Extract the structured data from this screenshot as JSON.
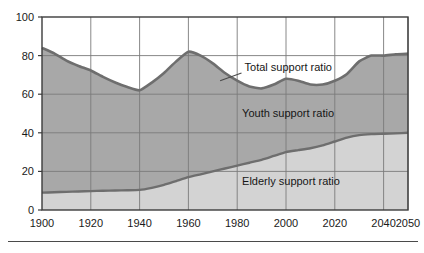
{
  "chart_data": {
    "type": "area",
    "title": "",
    "subtitle": "",
    "xlabel": "",
    "ylabel": "",
    "xlim": [
      1900,
      2050
    ],
    "ylim": [
      0,
      100
    ],
    "grid": true,
    "stacked": true,
    "legend_position": "inline-annotations",
    "xticks": [
      1900,
      1920,
      1940,
      1960,
      1980,
      2000,
      2020,
      2040,
      2050
    ],
    "xtick_labels": [
      "1900",
      "1920",
      "1940",
      "1960",
      "1980",
      "2000",
      "2020",
      "2040",
      "2050"
    ],
    "yticks": [
      0,
      20,
      40,
      60,
      80,
      100
    ],
    "ytick_labels": [
      "0",
      "20",
      "40",
      "60",
      "80",
      "100"
    ],
    "x": [
      1900,
      1905,
      1910,
      1915,
      1920,
      1925,
      1930,
      1935,
      1940,
      1945,
      1950,
      1955,
      1960,
      1965,
      1970,
      1975,
      1980,
      1985,
      1990,
      1995,
      2000,
      2005,
      2010,
      2015,
      2020,
      2025,
      2030,
      2035,
      2040,
      2045,
      2050
    ],
    "series": [
      {
        "name": "Elderly support ratio",
        "color": "#d3d3d3",
        "values": [
          9.0,
          9.2,
          9.4,
          9.6,
          9.8,
          10.0,
          10.1,
          10.2,
          10.4,
          11.5,
          13.0,
          15.0,
          17.0,
          18.5,
          20.0,
          21.5,
          23.0,
          24.5,
          26.0,
          28.0,
          30.0,
          31.0,
          32.0,
          33.5,
          35.5,
          37.5,
          38.8,
          39.3,
          39.5,
          39.7,
          40.0
        ]
      },
      {
        "name": "Youth support ratio",
        "color": "#a8a8a8",
        "values": [
          75.0,
          72.0,
          68.0,
          65.0,
          62.5,
          59.0,
          56.0,
          53.5,
          51.6,
          54.5,
          58.0,
          62.0,
          65.0,
          61.5,
          56.0,
          49.5,
          44.0,
          39.5,
          37.0,
          37.0,
          38.0,
          36.0,
          33.0,
          31.5,
          31.5,
          33.0,
          38.2,
          40.7,
          40.5,
          41.0,
          41.0
        ]
      }
    ],
    "total_line": {
      "name": "Total support ratio",
      "color": "#6e6e6e",
      "values": [
        84.0,
        81.2,
        77.4,
        74.6,
        72.3,
        69.0,
        66.1,
        63.7,
        62.0,
        66.0,
        71.0,
        77.0,
        82.0,
        80.0,
        76.0,
        71.0,
        67.0,
        64.0,
        63.0,
        65.0,
        68.0,
        67.0,
        65.0,
        65.0,
        67.0,
        70.5,
        77.0,
        80.0,
        80.0,
        80.7,
        81.0
      ]
    },
    "annotations": [
      {
        "name": "total-support-ratio",
        "text": "Total support ratio",
        "x": 1983,
        "y": 72,
        "leader_to_x": 1973,
        "leader_to_y": 67
      },
      {
        "name": "youth-support-ratio",
        "text": "Youth support ratio",
        "x": 1982,
        "y": 48,
        "leader_to_x": null,
        "leader_to_y": null
      },
      {
        "name": "elderly-support-ratio",
        "text": "Elderly support ratio",
        "x": 1982,
        "y": 13,
        "leader_to_x": null,
        "leader_to_y": null
      }
    ]
  },
  "colors": {
    "elderly_fill": "#d3d3d3",
    "youth_fill": "#a8a8a8",
    "total_line": "#6e6e6e",
    "grid": "#7a7a7a",
    "frame": "#3c3c3c",
    "text": "#1a1a1a",
    "background": "#ffffff"
  },
  "caption": {
    "rule": "",
    "fragment": ""
  }
}
